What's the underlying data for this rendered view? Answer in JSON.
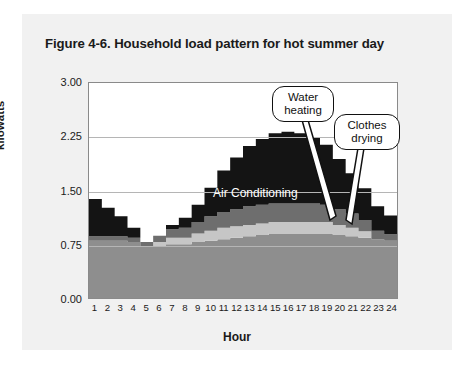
{
  "figure": {
    "title": "Figure 4-6. Household load pattern for hot summer day"
  },
  "chart_data": {
    "type": "area",
    "stacked": true,
    "title": "Figure 4-6. Household load pattern for hot summer day",
    "xlabel": "Hour",
    "ylabel": "kilowatts",
    "ylim": [
      0.0,
      3.0
    ],
    "yticks": [
      "0.00",
      "0.75",
      "1.50",
      "2.25",
      "3.00"
    ],
    "ytick_values": [
      0.0,
      0.75,
      1.5,
      2.25,
      3.0
    ],
    "grid": true,
    "legend": "inline-annotations",
    "categories": [
      1,
      2,
      3,
      4,
      5,
      6,
      7,
      8,
      9,
      10,
      11,
      12,
      13,
      14,
      15,
      16,
      17,
      18,
      19,
      20,
      21,
      22,
      23,
      24
    ],
    "xtick_labels": [
      "1",
      "2",
      "3",
      "4",
      "5",
      "6",
      "7",
      "8",
      "9",
      "10",
      "11",
      "12",
      "13",
      "14",
      "15",
      "16",
      "17",
      "18",
      "19",
      "20",
      "21",
      "22",
      "23",
      "24"
    ],
    "series": [
      {
        "name": "Base load",
        "color": "#8e8e8e",
        "values": [
          0.8,
          0.8,
          0.8,
          0.78,
          0.72,
          0.72,
          0.75,
          0.75,
          0.78,
          0.8,
          0.82,
          0.84,
          0.86,
          0.88,
          0.9,
          0.9,
          0.9,
          0.9,
          0.9,
          0.88,
          0.86,
          0.84,
          0.82,
          0.8
        ]
      },
      {
        "name": "Clothes drying",
        "color": "#c6c6c6",
        "values": [
          0.0,
          0.0,
          0.0,
          0.0,
          0.0,
          0.06,
          0.09,
          0.09,
          0.12,
          0.14,
          0.16,
          0.16,
          0.16,
          0.16,
          0.16,
          0.16,
          0.16,
          0.16,
          0.16,
          0.14,
          0.12,
          0.09,
          0.0,
          0.0
        ]
      },
      {
        "name": "Water heating",
        "color": "#6e6e6e",
        "values": [
          0.06,
          0.06,
          0.06,
          0.06,
          0.06,
          0.09,
          0.12,
          0.14,
          0.16,
          0.2,
          0.22,
          0.24,
          0.26,
          0.26,
          0.26,
          0.26,
          0.26,
          0.26,
          0.24,
          0.22,
          0.2,
          0.16,
          0.12,
          0.09
        ]
      },
      {
        "name": "Air Conditioning",
        "color": "#141414",
        "values": [
          0.52,
          0.4,
          0.28,
          0.14,
          0.0,
          0.0,
          0.06,
          0.14,
          0.24,
          0.4,
          0.58,
          0.72,
          0.84,
          0.92,
          0.98,
          1.0,
          0.98,
          0.92,
          0.84,
          0.7,
          0.56,
          0.44,
          0.34,
          0.26
        ]
      }
    ],
    "totals": [
      1.38,
      1.26,
      1.14,
      0.98,
      0.78,
      0.87,
      1.02,
      1.12,
      1.26,
      1.54,
      1.78,
      1.96,
      2.12,
      2.22,
      2.3,
      2.32,
      2.3,
      2.24,
      2.14,
      1.94,
      1.74,
      1.53,
      1.26,
      1.15
    ],
    "annotations": [
      {
        "name": "air-conditioning",
        "text": "Air Conditioning",
        "style": "inline-white"
      },
      {
        "name": "water-heating",
        "text_line1": "Water",
        "text_line2": "heating",
        "style": "callout"
      },
      {
        "name": "clothes-drying",
        "text_line1": "Clothes",
        "text_line2": "drying",
        "style": "callout"
      }
    ]
  },
  "colors": {
    "base_load": "#8e8e8e",
    "clothes_drying": "#c6c6c6",
    "water_heating": "#6e6e6e",
    "air_conditioning": "#141414",
    "page_panel": "#f1f1f1",
    "gridline": "#b5b5b5",
    "axis": "#8a8a8a",
    "text": "#1a1a1a"
  }
}
